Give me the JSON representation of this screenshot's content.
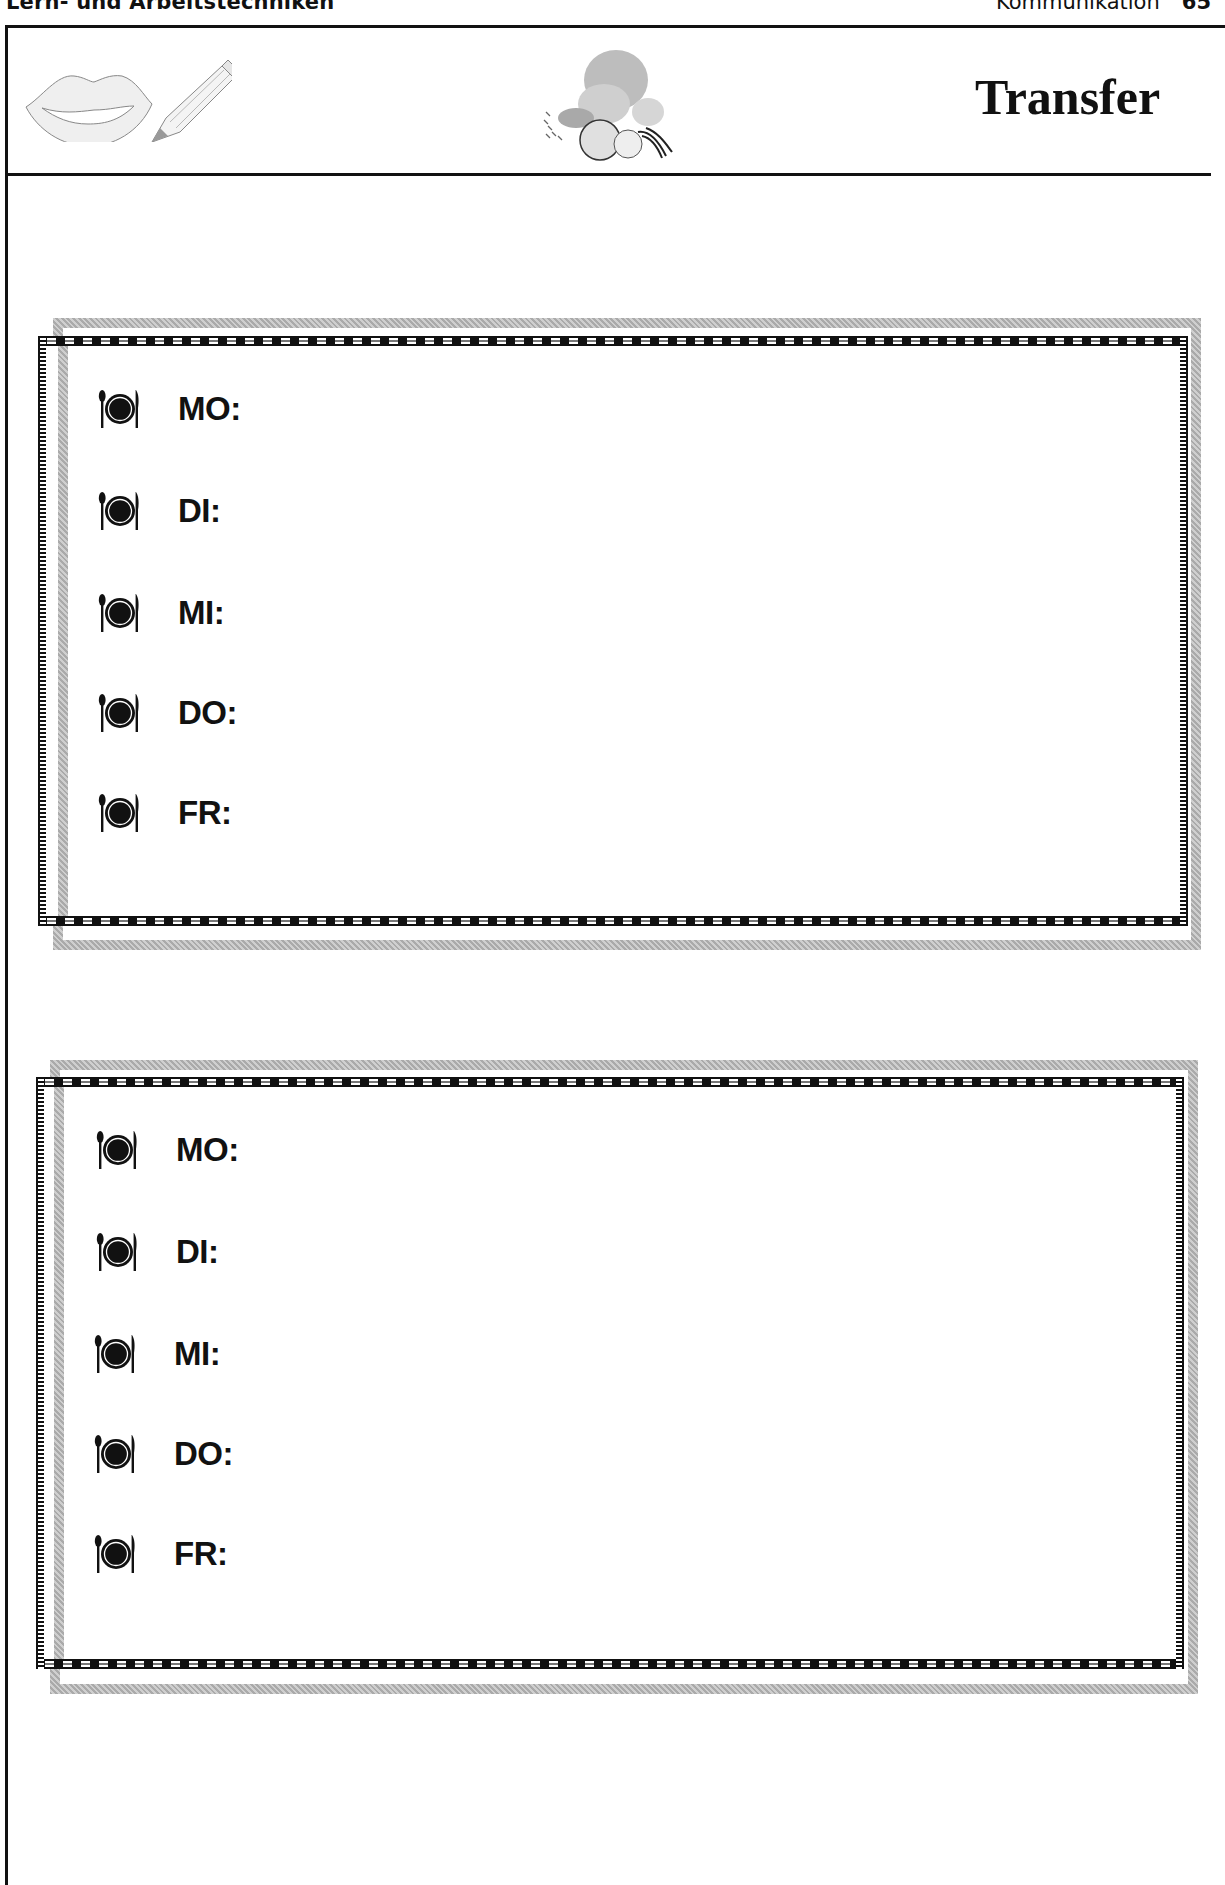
{
  "page_header": {
    "section_left": "Lern- und Arbeitstechniken",
    "section_right": "Kommunikation",
    "page_number": "65"
  },
  "worksheet": {
    "title": "Transfer",
    "clipart_left": [
      "lips-icon",
      "pencil-icon"
    ],
    "clipart_center": "food-illustration"
  },
  "boxes": [
    {
      "rows": [
        {
          "icon": "plate-cutlery-icon",
          "label": "MO:"
        },
        {
          "icon": "plate-cutlery-icon",
          "label": "DI:"
        },
        {
          "icon": "plate-cutlery-icon",
          "label": "MI:"
        },
        {
          "icon": "plate-cutlery-icon",
          "label": "DO:"
        },
        {
          "icon": "plate-cutlery-icon",
          "label": "FR:"
        }
      ]
    },
    {
      "rows": [
        {
          "icon": "plate-cutlery-icon",
          "label": "MO:"
        },
        {
          "icon": "plate-cutlery-icon",
          "label": "DI:"
        },
        {
          "icon": "plate-cutlery-icon",
          "label": "MI:"
        },
        {
          "icon": "plate-cutlery-icon",
          "label": "DO:"
        },
        {
          "icon": "plate-cutlery-icon",
          "label": "FR:"
        }
      ]
    }
  ],
  "colors": {
    "ink": "#111111",
    "frame_gray": "#b9b9b9"
  }
}
